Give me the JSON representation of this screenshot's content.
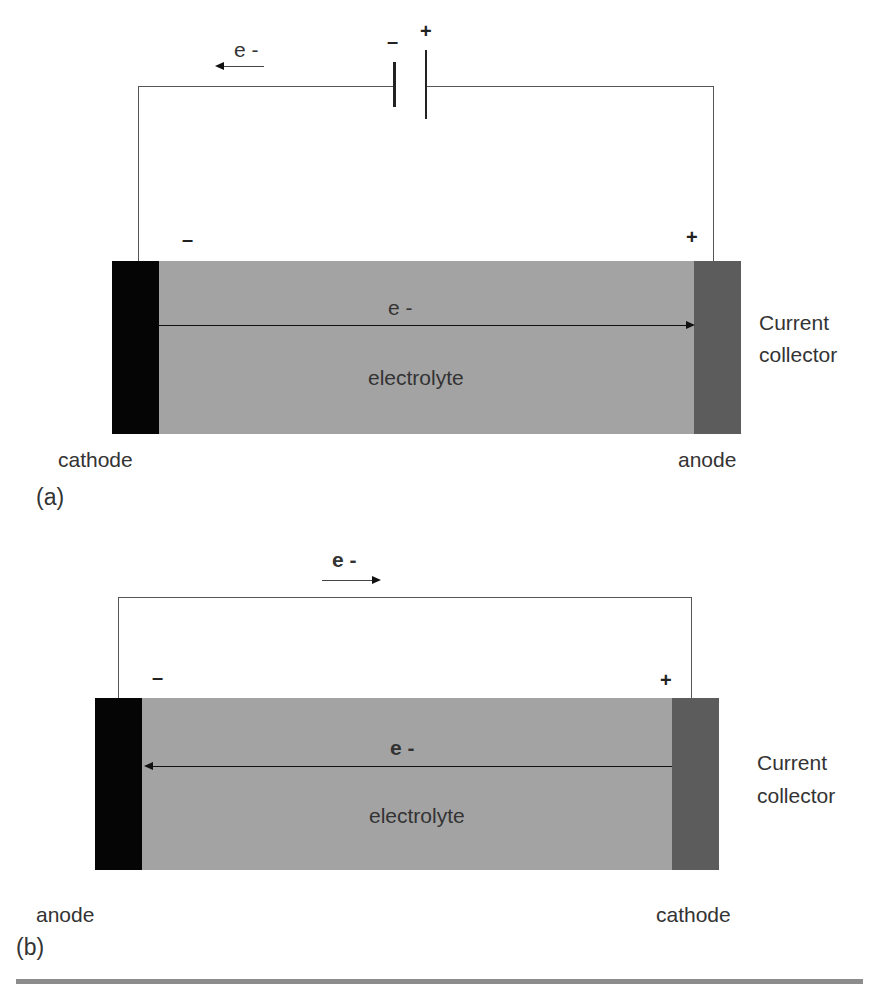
{
  "diagram_a": {
    "panel_label": "(a)",
    "battery": {
      "negative_sign": "–",
      "positive_sign": "+"
    },
    "external_electron_label": "e -",
    "external_electron_direction": "left",
    "left_terminal_sign": "–",
    "right_terminal_sign": "+",
    "internal_electron_label": "e -",
    "internal_electron_direction": "right",
    "electrolyte_label": "electrolyte",
    "left_electrode_label": "cathode",
    "right_electrode_label": "anode",
    "current_collector_label_line1": "Current",
    "current_collector_label_line2": "collector"
  },
  "diagram_b": {
    "panel_label": "(b)",
    "external_electron_label": "e -",
    "external_electron_direction": "right",
    "left_terminal_sign": "–",
    "right_terminal_sign": "+",
    "internal_electron_label": "e -",
    "internal_electron_direction": "left",
    "electrolyte_label": "electrolyte",
    "left_electrode_label": "anode",
    "right_electrode_label": "cathode",
    "current_collector_label_line1": "Current",
    "current_collector_label_line2": "collector"
  },
  "colors": {
    "electrolyte": "#a3a3a3",
    "left_electrode": "#050505",
    "right_electrode": "#5c5c5c",
    "wire": "#555555",
    "bottom_rule": "#8c8c8c"
  }
}
